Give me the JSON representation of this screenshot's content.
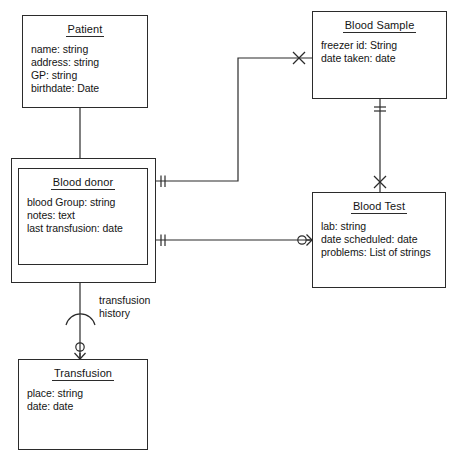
{
  "diagram": {
    "type": "uml-class-diagram",
    "background": "#ffffff",
    "line_color": "#2b2b2b",
    "text_color": "#141414"
  },
  "classes": [
    {
      "id": "patient",
      "name": "Patient",
      "attributes": [
        "name: string",
        "address: string",
        "GP: string",
        "birthdate: Date"
      ],
      "box": {
        "x": 22,
        "y": 15,
        "w": 126,
        "h": 93
      },
      "nested": false
    },
    {
      "id": "blood-donor",
      "name": "Blood donor",
      "attributes": [
        "blood Group: string",
        "notes: text",
        "last transfusion: date"
      ],
      "box": {
        "x": 18,
        "y": 168,
        "w": 130,
        "h": 97
      },
      "outer_box": {
        "x": 11,
        "y": 158,
        "w": 145,
        "h": 125
      },
      "nested": true
    },
    {
      "id": "blood-sample",
      "name": "Blood Sample",
      "attributes": [
        "freezer id: String",
        "date taken: date"
      ],
      "box": {
        "x": 312,
        "y": 11,
        "w": 135,
        "h": 88
      },
      "nested": false
    },
    {
      "id": "blood-test",
      "name": "Blood Test",
      "attributes": [
        "lab: string",
        "date scheduled: date",
        "problems: List of strings"
      ],
      "box": {
        "x": 312,
        "y": 192,
        "w": 134,
        "h": 96
      },
      "nested": false
    },
    {
      "id": "transfusion",
      "name": "Transfusion",
      "attributes": [
        "place: string",
        "date: date"
      ],
      "box": {
        "x": 18,
        "y": 359,
        "w": 130,
        "h": 91
      },
      "nested": false
    }
  ],
  "labels": {
    "transfusion_history_line1": "transfusion",
    "transfusion_history_line2": "history",
    "transfusion_history_pos": {
      "x": 99,
      "y": 294
    }
  },
  "associations": [
    {
      "id": "patient-blooddonor",
      "from": "patient",
      "to": "blood-donor",
      "kind": "generalization-plain-line",
      "end_markers": [
        "none",
        "none"
      ]
    },
    {
      "id": "blooddonor-bloodsample",
      "from": "blood-donor",
      "to": "blood-sample",
      "kind": "association",
      "end_markers": [
        "one-mandatory-double-tick",
        "zero-or-one-cross"
      ]
    },
    {
      "id": "bloodsample-bloodtest",
      "from": "blood-sample",
      "to": "blood-test",
      "kind": "association",
      "end_markers": [
        "one-mandatory-double-tick",
        "zero-or-one-cross"
      ]
    },
    {
      "id": "blooddonor-bloodtest",
      "from": "blood-donor",
      "to": "blood-test",
      "kind": "association",
      "end_markers": [
        "one-mandatory-double-tick",
        "zero-or-many-circle-crowsfoot"
      ]
    },
    {
      "id": "blooddonor-transfusion",
      "from": "blood-donor",
      "to": "transfusion",
      "kind": "association-ordered",
      "end_markers": [
        "one-mandatory-double-tick",
        "zero-or-many-circle-crowsfoot"
      ],
      "label": "transfusion history"
    }
  ]
}
